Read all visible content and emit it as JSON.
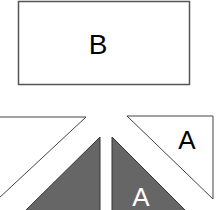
{
  "diagram": {
    "rectangle": {
      "label": "B",
      "fill": "#ffffff",
      "stroke": "#555555"
    },
    "triangles": [
      {
        "id": "top-left-white",
        "label": "",
        "fill": "#ffffff",
        "stroke": "#444444"
      },
      {
        "id": "bottom-left-dark",
        "label": "",
        "fill": "#666666",
        "stroke": "#333333"
      },
      {
        "id": "bottom-right-dark",
        "label": "A",
        "fill": "#666666",
        "stroke": "#333333",
        "label_color": "#ffffff"
      },
      {
        "id": "top-right-white",
        "label": "A",
        "fill": "#ffffff",
        "stroke": "#444444",
        "label_color": "#000000"
      }
    ]
  }
}
